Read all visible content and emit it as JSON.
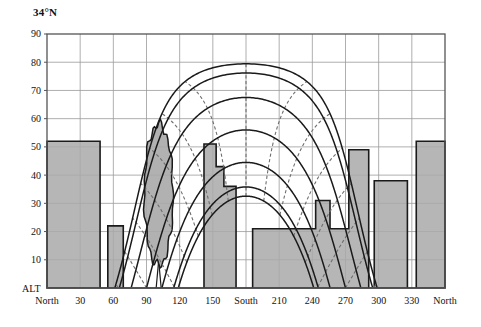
{
  "title": "34°N",
  "axis_origin_label": "ALT",
  "chart_data": {
    "type": "line",
    "title": "34°N",
    "subtitle": "Sun path diagram with horizon obstruction profile",
    "xlabel": "",
    "ylabel": "ALT",
    "grid": true,
    "legend_position": "none",
    "xlim": [
      0,
      360
    ],
    "ylim": [
      0,
      90
    ],
    "x_tick_values": [
      0,
      30,
      60,
      90,
      120,
      150,
      180,
      210,
      240,
      270,
      300,
      330,
      360
    ],
    "x_tick_labels": [
      "North",
      "30",
      "60",
      "90",
      "120",
      "150",
      "South",
      "210",
      "240",
      "270",
      "300",
      "330",
      "North"
    ],
    "y_tick_values": [
      0,
      10,
      20,
      30,
      40,
      50,
      60,
      70,
      80,
      90
    ],
    "y_tick_labels": [
      "ALT",
      "10",
      "20",
      "30",
      "40",
      "50",
      "60",
      "70",
      "80",
      "90"
    ],
    "series": [
      {
        "name": "Sun path — summer solstice (Jun 21)",
        "style": "solid",
        "declination": 23.45,
        "peak_altitude": 79.5,
        "sunrise_azimuth": 62,
        "sunset_azimuth": 298
      },
      {
        "name": "Sun path — May/Jul",
        "style": "solid",
        "declination": 20.2,
        "peak_altitude": 76.2,
        "sunrise_azimuth": 65,
        "sunset_azimuth": 295
      },
      {
        "name": "Sun path — Apr/Aug",
        "style": "solid",
        "declination": 11.5,
        "peak_altitude": 67.5,
        "sunrise_azimuth": 76,
        "sunset_azimuth": 284
      },
      {
        "name": "Sun path — Mar/Sep equinox",
        "style": "solid",
        "declination": 0.0,
        "peak_altitude": 56.0,
        "sunrise_azimuth": 90,
        "sunset_azimuth": 270
      },
      {
        "name": "Sun path — Feb/Oct",
        "style": "solid",
        "declination": -11.5,
        "peak_altitude": 44.5,
        "sunrise_azimuth": 104,
        "sunset_azimuth": 256
      },
      {
        "name": "Sun path — Jan/Nov",
        "style": "solid",
        "declination": -20.2,
        "peak_altitude": 35.8,
        "sunrise_azimuth": 115,
        "sunset_azimuth": 245
      },
      {
        "name": "Sun path — winter solstice (Dec 21)",
        "style": "solid",
        "declination": -23.45,
        "peak_altitude": 32.5,
        "sunrise_azimuth": 119,
        "sunset_azimuth": 241
      }
    ],
    "hour_lines": {
      "name": "Hour lines (solar time)",
      "style": "dashed",
      "hours": [
        5,
        6,
        7,
        8,
        9,
        10,
        11,
        12,
        13,
        14,
        15,
        16,
        17,
        18,
        19
      ]
    },
    "obstruction_profile": {
      "name": "Horizon obstruction (buildings)",
      "fill": "#a9a9a9",
      "stroke": "#1a1a1a",
      "segments": [
        {
          "azimuth_start": 0,
          "azimuth_end": 48,
          "altitude": 52
        },
        {
          "azimuth_start": 48,
          "azimuth_end": 55,
          "altitude": 0
        },
        {
          "azimuth_start": 55,
          "azimuth_end": 69,
          "altitude": 22
        },
        {
          "azimuth_start": 69,
          "azimuth_end": 142,
          "altitude": 0
        },
        {
          "azimuth_start": 142,
          "azimuth_end": 153,
          "altitude": 51
        },
        {
          "azimuth_start": 153,
          "azimuth_end": 160,
          "altitude": 43
        },
        {
          "azimuth_start": 160,
          "azimuth_end": 171,
          "altitude": 36
        },
        {
          "azimuth_start": 171,
          "azimuth_end": 186,
          "altitude": 0
        },
        {
          "azimuth_start": 186,
          "azimuth_end": 243,
          "altitude": 21
        },
        {
          "azimuth_start": 243,
          "azimuth_end": 256,
          "altitude": 31
        },
        {
          "azimuth_start": 256,
          "azimuth_end": 273,
          "altitude": 21
        },
        {
          "azimuth_start": 273,
          "azimuth_end": 291,
          "altitude": 49
        },
        {
          "azimuth_start": 291,
          "azimuth_end": 296,
          "altitude": 0
        },
        {
          "azimuth_start": 296,
          "azimuth_end": 326,
          "altitude": 38
        },
        {
          "azimuth_start": 326,
          "azimuth_end": 334,
          "altitude": 0
        },
        {
          "azimuth_start": 334,
          "azimuth_end": 360,
          "altitude": 52
        }
      ]
    },
    "tree_obstruction": {
      "name": "Tree obstruction",
      "fill": "#a9a9a9",
      "stroke": "#1a1a1a",
      "crown_center_azimuth": 101,
      "crown_center_altitude": 33,
      "crown_half_width_deg": 13,
      "crown_half_height_deg": 25,
      "trunk_azimuth": 101,
      "trunk_top_altitude": 9,
      "outline_style": "scalloped"
    },
    "colors": {
      "grid": "#9a9a9a",
      "axis": "#555555",
      "sunpath": "#1a1a1a",
      "hourline": "#6e6e6e",
      "obstruction_fill": "#a9a9a9",
      "obstruction_stroke": "#1a1a1a",
      "background": "#ffffff"
    }
  }
}
